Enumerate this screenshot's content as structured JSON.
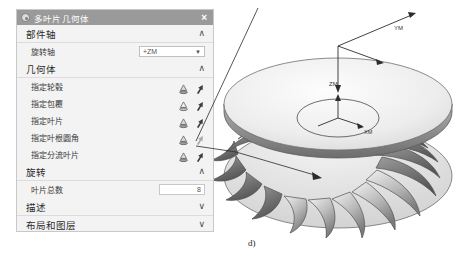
{
  "dialog": {
    "title": "多叶片几何体",
    "gear_icon": "gear-icon",
    "close_icon": "×",
    "sections": [
      {
        "label": "部件轴",
        "chevron": "∧"
      },
      {
        "label": "几何体",
        "chevron": "∧"
      },
      {
        "label": "旋转",
        "chevron": "∧"
      },
      {
        "label": "描述",
        "chevron": "∨"
      },
      {
        "label": "布局和图层",
        "chevron": "∨"
      }
    ],
    "rotation_axis": {
      "label": "旋转轴",
      "value": "+ZM",
      "arrow": "▼"
    },
    "geometry_rows": [
      {
        "label": "指定轮毂",
        "cone_icon": "cone-select-icon",
        "cursor_icon": "arrow-cursor-icon",
        "dim": false
      },
      {
        "label": "指定包覆",
        "cone_icon": "cone-select-icon",
        "cursor_icon": "arrow-cursor-icon",
        "dim": false
      },
      {
        "label": "指定叶片",
        "cone_icon": "cone-select-icon",
        "cursor_icon": "arrow-cursor-icon",
        "dim": false
      },
      {
        "label": "指定叶根圆角",
        "cone_icon": "cone-select-icon",
        "cursor_icon": "arrow-cursor-icon",
        "dim": true
      },
      {
        "label": "指定分流叶片",
        "cone_icon": "cone-select-icon",
        "cursor_icon": "arrow-cursor-icon",
        "dim": false
      }
    ],
    "blade_count": {
      "label": "叶片总数",
      "value": "8"
    },
    "buttons": {
      "ok": "确定",
      "cancel": "取消"
    }
  },
  "viewport": {
    "axis_labels": {
      "zm": "ZM",
      "ym": "YM",
      "xm": "XM"
    },
    "model_name": "impeller-blade-model",
    "figure_label": "d)"
  },
  "colors": {
    "titlebar": "#9a9a9a",
    "dialog_bg": "#f3f3f3",
    "primary_button": "#b9b9b9",
    "model_light": "#eeeeee",
    "model_mid": "#bdbdbd",
    "model_dark": "#6f6f6f"
  }
}
